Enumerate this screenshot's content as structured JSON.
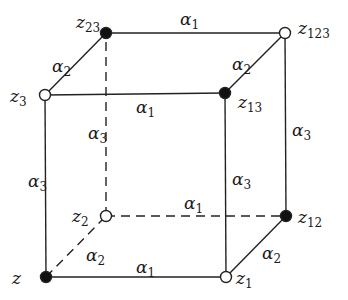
{
  "diagram": {
    "type": "cube-lattice",
    "colors": {
      "line": "#222222",
      "filled_node": "#111111",
      "open_node_fill": "#ffffff"
    },
    "nodes": [
      {
        "id": "z",
        "base": "z",
        "sub": "",
        "x": 46,
        "y": 277,
        "filled": true,
        "lx": 12,
        "ly": 284
      },
      {
        "id": "z1",
        "base": "z",
        "sub": "1",
        "x": 226,
        "y": 277,
        "filled": false,
        "lx": 236,
        "ly": 284
      },
      {
        "id": "z2",
        "base": "z",
        "sub": "2",
        "x": 106,
        "y": 216,
        "filled": false,
        "lx": 72,
        "ly": 222
      },
      {
        "id": "z3",
        "base": "z",
        "sub": "3",
        "x": 45,
        "y": 95,
        "filled": false,
        "lx": 10,
        "ly": 102
      },
      {
        "id": "z12",
        "base": "z",
        "sub": "12",
        "x": 286,
        "y": 216,
        "filled": true,
        "lx": 298,
        "ly": 223
      },
      {
        "id": "z13",
        "base": "z",
        "sub": "13",
        "x": 225,
        "y": 93,
        "filled": true,
        "lx": 238,
        "ly": 108
      },
      {
        "id": "z23",
        "base": "z",
        "sub": "23",
        "x": 106,
        "y": 33,
        "filled": true,
        "lx": 76,
        "ly": 28
      },
      {
        "id": "z123",
        "base": "z",
        "sub": "123",
        "x": 285,
        "y": 33,
        "filled": false,
        "lx": 298,
        "ly": 34
      }
    ],
    "edges": [
      {
        "from": "z",
        "to": "z1",
        "dashed": false,
        "label": "α",
        "sub": "1",
        "lx": 136,
        "ly": 273
      },
      {
        "from": "z3",
        "to": "z13",
        "dashed": false,
        "label": "α",
        "sub": "1",
        "lx": 136,
        "ly": 113
      },
      {
        "from": "z23",
        "to": "z123",
        "dashed": false,
        "label": "α",
        "sub": "1",
        "lx": 180,
        "ly": 25
      },
      {
        "from": "z2",
        "to": "z12",
        "dashed": true,
        "label": "α",
        "sub": "1",
        "lx": 184,
        "ly": 209
      },
      {
        "from": "z3",
        "to": "z23",
        "dashed": false,
        "label": "α",
        "sub": "2",
        "lx": 52,
        "ly": 72
      },
      {
        "from": "z13",
        "to": "z123",
        "dashed": false,
        "label": "α",
        "sub": "2",
        "lx": 232,
        "ly": 70
      },
      {
        "from": "z",
        "to": "z2",
        "dashed": true,
        "label": "α",
        "sub": "2",
        "lx": 86,
        "ly": 261
      },
      {
        "from": "z1",
        "to": "z12",
        "dashed": false,
        "label": "α",
        "sub": "2",
        "lx": 262,
        "ly": 259
      },
      {
        "from": "z",
        "to": "z3",
        "dashed": false,
        "label": "α",
        "sub": "3",
        "lx": 28,
        "ly": 187
      },
      {
        "from": "z1",
        "to": "z13",
        "dashed": false,
        "label": "α",
        "sub": "3",
        "lx": 232,
        "ly": 185
      },
      {
        "from": "z12",
        "to": "z123",
        "dashed": false,
        "label": "α",
        "sub": "3",
        "lx": 292,
        "ly": 136
      },
      {
        "from": "z2",
        "to": "z23",
        "dashed": true,
        "label": "α",
        "sub": "3",
        "lx": 88,
        "ly": 139
      }
    ]
  }
}
